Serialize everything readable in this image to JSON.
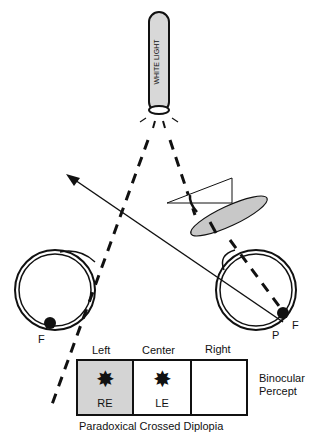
{
  "light_source": {
    "label": "WHITE LIGHT"
  },
  "eyes": {
    "left": {
      "fovea_label": "F"
    },
    "right": {
      "fovea_label": "F",
      "point_label": "P"
    }
  },
  "percept": {
    "columns": [
      "Left",
      "Center",
      "Right"
    ],
    "cells": [
      {
        "label": "RE",
        "shaded": true,
        "has_star": true
      },
      {
        "label": "LE",
        "shaded": false,
        "has_star": true
      },
      {
        "label": "",
        "shaded": false,
        "has_star": false
      }
    ],
    "side_label_line1": "Binocular",
    "side_label_line2": "Percept",
    "caption": "Paradoxical Crossed Diplopia"
  },
  "colors": {
    "shade": "#d4d4d4",
    "line": "#111111"
  }
}
